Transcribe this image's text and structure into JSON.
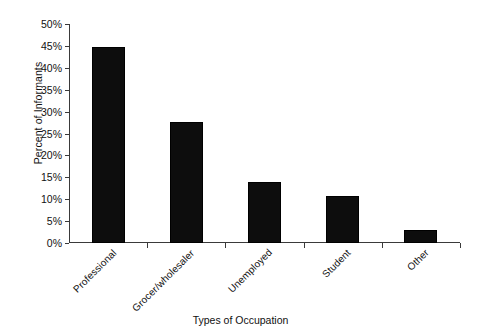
{
  "chart_data": {
    "type": "bar",
    "title": "",
    "xlabel": "Types of Occupation",
    "ylabel": "Percent of Informants",
    "categories": [
      "Professional",
      "Grocer/wholesaler",
      "Unemployed",
      "Student",
      "Other"
    ],
    "values": [
      44.8,
      27.6,
      13.9,
      10.8,
      3.0
    ],
    "ylim": [
      0,
      50
    ],
    "ytick_values": [
      0,
      5,
      10,
      15,
      20,
      25,
      30,
      35,
      40,
      45,
      50
    ],
    "ytick_labels": [
      "0%",
      "5%",
      "10%",
      "15%",
      "20%",
      "25%",
      "30%",
      "35%",
      "40%",
      "45%",
      "50%"
    ],
    "grid": false,
    "legend": false,
    "bar_color": "#0d0d0d",
    "axis_color": "#3a3a3a"
  }
}
